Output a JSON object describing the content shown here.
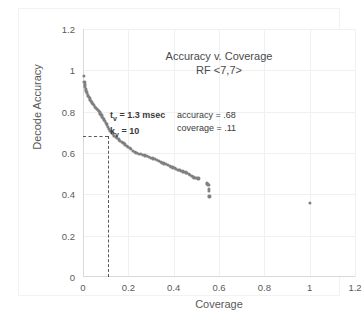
{
  "chart_data": {
    "type": "scatter",
    "title": "Accuracy v. Coverage",
    "subtitle": "RF <7,7>",
    "xlabel": "Coverage",
    "ylabel": "Decode Accuracy",
    "xlim": [
      0,
      1.2
    ],
    "ylim": [
      0,
      1.2
    ],
    "xticks": [
      "0",
      "0.2",
      "0.4",
      "0.6",
      "0.8",
      "1",
      "1.2"
    ],
    "xtick_values": [
      0,
      0.2,
      0.4,
      0.6,
      0.8,
      1.0,
      1.2
    ],
    "yticks": [
      "0",
      "0.2",
      "0.4",
      "0.6",
      "0.8",
      "1",
      "1.2"
    ],
    "ytick_values": [
      0,
      0.2,
      0.4,
      0.6,
      0.8,
      1.0,
      1.2
    ],
    "grid": true,
    "legend": "none",
    "marker_color": "#808080",
    "series": [
      {
        "name": "accuracy vs coverage",
        "points": [
          [
            0.004,
            0.972
          ],
          [
            0.006,
            0.945
          ],
          [
            0.008,
            0.932
          ],
          [
            0.01,
            0.922
          ],
          [
            0.012,
            0.912
          ],
          [
            0.014,
            0.903
          ],
          [
            0.016,
            0.896
          ],
          [
            0.018,
            0.889
          ],
          [
            0.02,
            0.882
          ],
          [
            0.023,
            0.876
          ],
          [
            0.026,
            0.87
          ],
          [
            0.029,
            0.864
          ],
          [
            0.032,
            0.858
          ],
          [
            0.035,
            0.853
          ],
          [
            0.038,
            0.847
          ],
          [
            0.041,
            0.842
          ],
          [
            0.045,
            0.836
          ],
          [
            0.049,
            0.831
          ],
          [
            0.053,
            0.825
          ],
          [
            0.057,
            0.82
          ],
          [
            0.061,
            0.814
          ],
          [
            0.065,
            0.808
          ],
          [
            0.069,
            0.802
          ],
          [
            0.073,
            0.796
          ],
          [
            0.077,
            0.79
          ],
          [
            0.081,
            0.784
          ],
          [
            0.085,
            0.777
          ],
          [
            0.089,
            0.77
          ],
          [
            0.093,
            0.763
          ],
          [
            0.097,
            0.755
          ],
          [
            0.101,
            0.747
          ],
          [
            0.105,
            0.738
          ],
          [
            0.11,
            0.728
          ],
          [
            0.115,
            0.718
          ],
          [
            0.12,
            0.708
          ],
          [
            0.126,
            0.699
          ],
          [
            0.132,
            0.691
          ],
          [
            0.138,
            0.684
          ],
          [
            0.144,
            0.678
          ],
          [
            0.15,
            0.672
          ],
          [
            0.157,
            0.666
          ],
          [
            0.164,
            0.66
          ],
          [
            0.171,
            0.654
          ],
          [
            0.178,
            0.648
          ],
          [
            0.185,
            0.642
          ],
          [
            0.192,
            0.636
          ],
          [
            0.199,
            0.63
          ],
          [
            0.206,
            0.624
          ],
          [
            0.213,
            0.618
          ],
          [
            0.22,
            0.612
          ],
          [
            0.228,
            0.606
          ],
          [
            0.236,
            0.601
          ],
          [
            0.245,
            0.597
          ],
          [
            0.254,
            0.594
          ],
          [
            0.263,
            0.591
          ],
          [
            0.272,
            0.588
          ],
          [
            0.281,
            0.585
          ],
          [
            0.29,
            0.581
          ],
          [
            0.299,
            0.578
          ],
          [
            0.308,
            0.574
          ],
          [
            0.317,
            0.57
          ],
          [
            0.326,
            0.566
          ],
          [
            0.334,
            0.562
          ],
          [
            0.342,
            0.558
          ],
          [
            0.35,
            0.554
          ],
          [
            0.358,
            0.55
          ],
          [
            0.366,
            0.546
          ],
          [
            0.374,
            0.542
          ],
          [
            0.382,
            0.538
          ],
          [
            0.39,
            0.534
          ],
          [
            0.397,
            0.53
          ],
          [
            0.404,
            0.526
          ],
          [
            0.411,
            0.523
          ],
          [
            0.418,
            0.52
          ],
          [
            0.425,
            0.517
          ],
          [
            0.432,
            0.514
          ],
          [
            0.439,
            0.511
          ],
          [
            0.446,
            0.508
          ],
          [
            0.453,
            0.506
          ],
          [
            0.46,
            0.504
          ],
          [
            0.467,
            0.5
          ],
          [
            0.473,
            0.494
          ],
          [
            0.479,
            0.489
          ],
          [
            0.485,
            0.485
          ],
          [
            0.491,
            0.482
          ],
          [
            0.497,
            0.48
          ],
          [
            0.503,
            0.478
          ],
          [
            0.509,
            0.477
          ],
          [
            0.545,
            0.457
          ],
          [
            0.549,
            0.452
          ],
          [
            0.553,
            0.447
          ],
          [
            0.556,
            0.425
          ],
          [
            0.557,
            0.418
          ],
          [
            0.558,
            0.39
          ],
          [
            1.0,
            0.36
          ]
        ]
      }
    ],
    "annotations": [
      {
        "id": "t-v",
        "text": "t",
        "sub": "v",
        "tail": " = 1.3 msec"
      },
      {
        "id": "k-v",
        "text": "k",
        "sub": "v",
        "tail": " = 10"
      },
      {
        "id": "accuracy",
        "text": "accuracy =  .68"
      },
      {
        "id": "coverage",
        "text": "coverage = .11"
      }
    ],
    "leader_lines": {
      "x_value": 0.11,
      "y_value": 0.683,
      "style": "dashed",
      "color": "#595959"
    }
  },
  "chart": {
    "title_line1": "Accuracy v. Coverage",
    "title_line2": "RF <7,7>",
    "x_axis_title": "Coverage",
    "y_axis_title": "Decode Accuracy",
    "annot_t_symbol": "t",
    "annot_t_sub": "v",
    "annot_t_value": " = 1.3 msec",
    "annot_k_symbol": "k",
    "annot_k_sub": "v",
    "annot_k_value": " = 10",
    "annot_accuracy": "accuracy =  .68",
    "annot_coverage": "coverage = .11"
  }
}
